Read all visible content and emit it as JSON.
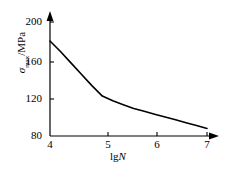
{
  "chart_data": {
    "type": "line",
    "title": "",
    "subtitle": "",
    "xlabel": "lgN",
    "ylabel": "σmax/MPa",
    "xlabel_parts": {
      "prefix": "lg",
      "symbol": "N"
    },
    "ylabel_parts": {
      "symbol": "σ",
      "subscript": "max",
      "unit": "/MPa"
    },
    "xlim": [
      4,
      7
    ],
    "ylim": [
      80,
      210
    ],
    "xticks": [
      4,
      5,
      6,
      7
    ],
    "xtick_labels": [
      "4",
      "5",
      "6",
      "7"
    ],
    "yticks": [
      80,
      120,
      160,
      200
    ],
    "ytick_labels": [
      "80",
      "120",
      "160",
      "200"
    ],
    "grid": false,
    "legend": null,
    "axis_arrows": {
      "x": "right",
      "y": "up"
    },
    "series": [
      {
        "name": "S-N curve",
        "color": "#000000",
        "linewidth": 1.6,
        "x": [
          4.0,
          4.2,
          4.4,
          4.6,
          4.8,
          5.0,
          5.2,
          5.4,
          5.6,
          5.8,
          6.0,
          6.2,
          6.4,
          6.6,
          6.8,
          7.0
        ],
        "values": [
          180,
          169,
          157,
          145,
          133,
          122,
          117,
          113,
          109,
          106,
          103,
          100,
          97,
          94,
          91,
          88
        ]
      }
    ]
  },
  "axes": {
    "y_tick_positions_px": [
      22,
      62,
      99,
      136
    ],
    "x_tick_positions_px": [
      50,
      108,
      157,
      207
    ]
  },
  "colors": {
    "background": "#ffffff",
    "axis": "#000000",
    "curve": "#000000",
    "text": "#000000"
  }
}
